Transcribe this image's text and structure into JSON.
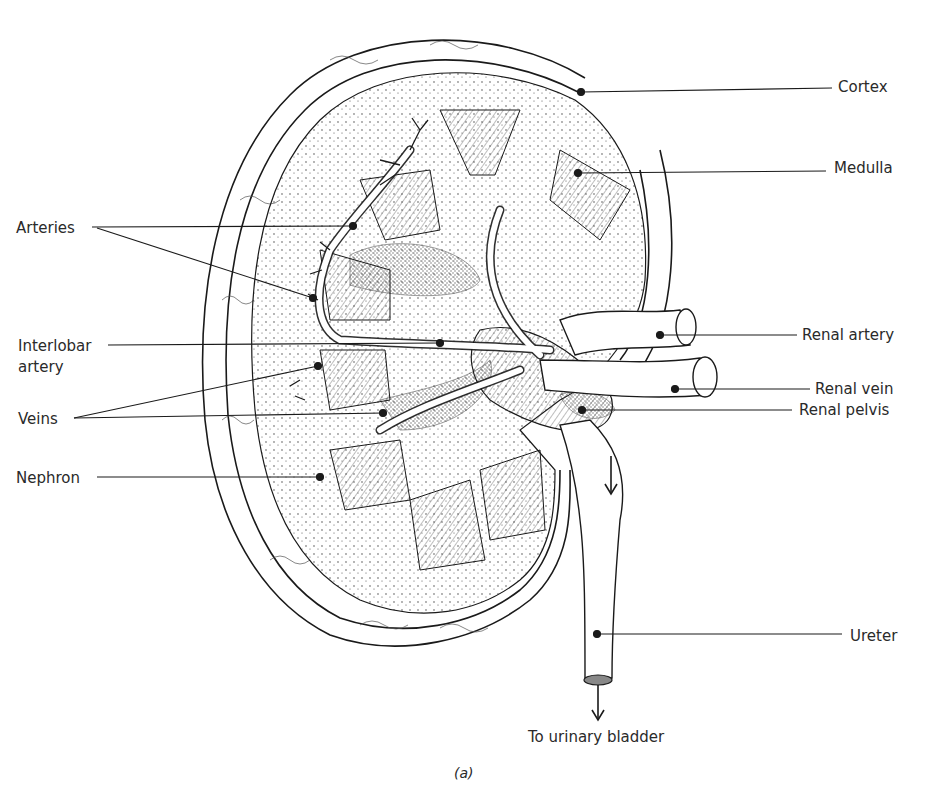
{
  "figure": {
    "caption": "(a)",
    "ink_color": "#1a1a1a",
    "background": "#ffffff"
  },
  "labels": [
    {
      "id": "cortex",
      "text": "Cortex",
      "x": 838,
      "y": 78,
      "line": {
        "x1": 581,
        "y1": 92,
        "x2": 832,
        "y2": 88
      }
    },
    {
      "id": "medulla",
      "text": "Medulla",
      "x": 834,
      "y": 159,
      "line": {
        "x1": 578,
        "y1": 173,
        "x2": 826,
        "y2": 171
      }
    },
    {
      "id": "arteries",
      "text": "Arteries",
      "x": 16,
      "y": 219,
      "lines": [
        {
          "x1": 92,
          "y1": 227,
          "x2": 353,
          "y2": 226
        },
        {
          "x1": 97,
          "y1": 228,
          "x2": 313,
          "y2": 298
        }
      ]
    },
    {
      "id": "interlobar_artery",
      "text_line1": "Interlobar",
      "text_line2": "artery",
      "x": 18,
      "y": 337,
      "line": {
        "x1": 108,
        "y1": 345,
        "x2": 440,
        "y2": 343
      }
    },
    {
      "id": "veins",
      "text": "Veins",
      "x": 18,
      "y": 410,
      "lines": [
        {
          "x1": 74,
          "y1": 418,
          "x2": 318,
          "y2": 366
        },
        {
          "x1": 74,
          "y1": 418,
          "x2": 383,
          "y2": 413
        }
      ]
    },
    {
      "id": "nephron",
      "text": "Nephron",
      "x": 16,
      "y": 469,
      "line": {
        "x1": 97,
        "y1": 477,
        "x2": 320,
        "y2": 477
      }
    },
    {
      "id": "renal_artery",
      "text": "Renal artery",
      "x": 802,
      "y": 326,
      "line": {
        "x1": 660,
        "y1": 335,
        "x2": 797,
        "y2": 335
      }
    },
    {
      "id": "renal_vein",
      "text": "Renal vein",
      "x": 815,
      "y": 380,
      "line": {
        "x1": 675,
        "y1": 389,
        "x2": 810,
        "y2": 389
      }
    },
    {
      "id": "renal_pelvis",
      "text": "Renal pelvis",
      "x": 799,
      "y": 401,
      "line": {
        "x1": 582,
        "y1": 410,
        "x2": 792,
        "y2": 410
      }
    },
    {
      "id": "ureter",
      "text": "Ureter",
      "x": 850,
      "y": 627,
      "line": {
        "x1": 597,
        "y1": 634,
        "x2": 842,
        "y2": 634
      }
    },
    {
      "id": "to_urinary_bladder",
      "text": "To urinary bladder",
      "x": 528,
      "y": 728
    }
  ],
  "arrows": [
    {
      "id": "ureter-flow-arrow",
      "x1": 611,
      "y1": 456,
      "x2": 611,
      "y2": 492
    },
    {
      "id": "bladder-arrow",
      "x1": 598,
      "y1": 685,
      "x2": 598,
      "y2": 718
    }
  ]
}
